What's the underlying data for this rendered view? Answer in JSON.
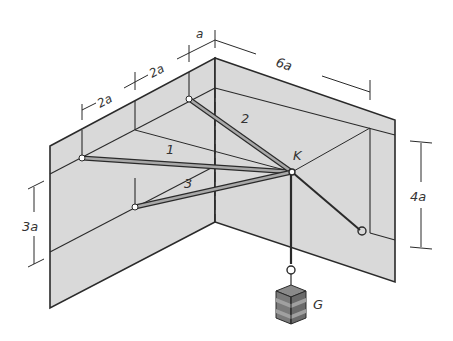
{
  "diagram": {
    "colors": {
      "wall_fill": "#d9d9d9",
      "line": "#2a2a2a",
      "rod_fill": "#a8a8a8",
      "weight_dark": "#6e6e6e",
      "weight_light": "#a0a0a0"
    },
    "labels": {
      "node": "K",
      "weight": "G",
      "rod1": "1",
      "rod2": "2",
      "rod3": "3"
    },
    "dimensions": {
      "top_left_1": "2a",
      "top_left_2": "2a",
      "top_small": "a",
      "top_right": "6a",
      "left_height": "3a",
      "right_height": "4a"
    }
  }
}
